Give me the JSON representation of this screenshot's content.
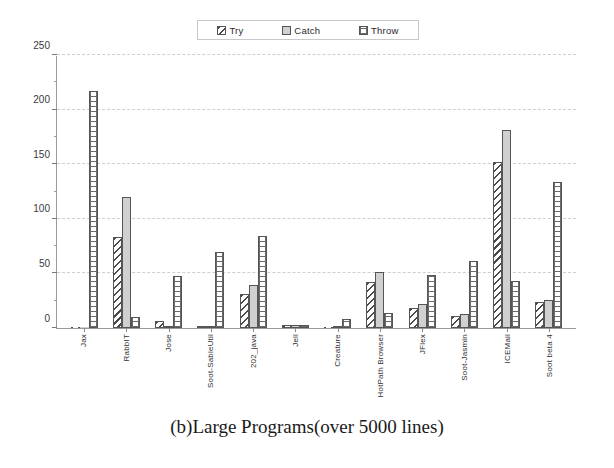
{
  "caption": "(b)Large Programs(over 5000 lines)",
  "legend": {
    "items": [
      {
        "label": "Try",
        "pattern": "diagonal-hatch",
        "color": "#4a4a4a"
      },
      {
        "label": "Catch",
        "pattern": "solid-gray",
        "color": "#d0d0d0"
      },
      {
        "label": "Throw",
        "pattern": "brick-grid",
        "color": "#6a6a6a"
      }
    ]
  },
  "chart_data": {
    "type": "bar",
    "title": "(b)Large Programs(over 5000 lines)",
    "xlabel": "",
    "ylabel": "",
    "ylim": [
      0,
      250
    ],
    "yticks": [
      0,
      50,
      100,
      150,
      200,
      250
    ],
    "ytick_labels": [
      "0",
      "50",
      "100",
      "150",
      "200",
      "250"
    ],
    "yminor_step": 25,
    "grid": true,
    "legend_position": "top-center",
    "categories": [
      "Jax",
      "RabbIT",
      "Jose",
      "Soot-SableUtil",
      "202_java",
      "Jell",
      "Creature",
      "HotPath Browser",
      "JFlex",
      "Soot-Jasmin",
      "ICEMail",
      "Soot beta 4"
    ],
    "series": [
      {
        "name": "Try",
        "values": [
          0,
          83,
          6,
          2,
          31,
          3,
          0,
          42,
          18,
          11,
          152,
          24
        ]
      },
      {
        "name": "Catch",
        "values": [
          0,
          120,
          2,
          1,
          39,
          3,
          1,
          51,
          22,
          13,
          181,
          26
        ]
      },
      {
        "name": "Throw",
        "values": [
          217,
          10,
          48,
          70,
          84,
          3,
          8,
          14,
          49,
          61,
          43,
          134
        ]
      }
    ]
  }
}
